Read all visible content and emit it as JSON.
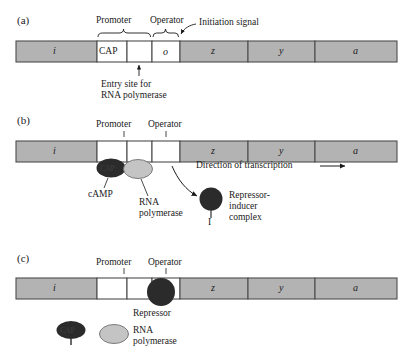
{
  "figure": {
    "colors": {
      "gene_fill": "#b3b3b3",
      "gene_stroke": "#4d4d4d",
      "white_fill": "#ffffff",
      "repressor_fill": "#2b2b2b",
      "cap_fill": "#2b2b2b",
      "polymerase_fill": "#c4c4c4",
      "line": "#1a1a1a"
    }
  },
  "panels": [
    {
      "id": "a",
      "label": "(a)",
      "segments": [
        {
          "name": "i",
          "label": "i",
          "filled": true
        },
        {
          "name": "cap",
          "label": "CAP",
          "filled": false
        },
        {
          "name": "entry",
          "label": "",
          "filled": false
        },
        {
          "name": "o",
          "label": "o",
          "filled": false
        },
        {
          "name": "z",
          "label": "z",
          "filled": true
        },
        {
          "name": "y",
          "label": "y",
          "filled": true
        },
        {
          "name": "a",
          "label": "a",
          "filled": true
        }
      ],
      "brackets": [
        {
          "name": "promoter",
          "label": "Promoter"
        },
        {
          "name": "operator",
          "label": "Operator"
        }
      ],
      "annotations": [
        {
          "name": "initiation-signal",
          "label": "Initiation signal"
        },
        {
          "name": "entry-site",
          "line1": "Entry site for",
          "line2": "RNA polymerase"
        }
      ]
    },
    {
      "id": "b",
      "label": "(b)",
      "segments": [
        {
          "name": "i",
          "label": "i",
          "filled": true
        },
        {
          "name": "cap",
          "label": "",
          "filled": false
        },
        {
          "name": "entry",
          "label": "",
          "filled": false
        },
        {
          "name": "o",
          "label": "",
          "filled": false
        },
        {
          "name": "z",
          "label": "z",
          "filled": true
        },
        {
          "name": "y",
          "label": "y",
          "filled": true
        },
        {
          "name": "a",
          "label": "a",
          "filled": true
        }
      ],
      "brackets": [
        {
          "name": "promoter",
          "label": "Promoter"
        },
        {
          "name": "operator",
          "label": "Operator"
        }
      ],
      "annotations": [
        {
          "name": "cap-protein",
          "label": "CAP"
        },
        {
          "name": "camp",
          "label": "cAMP"
        },
        {
          "name": "rna-polymerase",
          "line1": "RNA",
          "line2": "polymerase"
        },
        {
          "name": "direction-of-transcription",
          "label": "Direction of transcription"
        },
        {
          "name": "inducer",
          "label": "I"
        },
        {
          "name": "repressor-inducer-complex",
          "line1": "Repressor-",
          "line2": "inducer",
          "line3": "complex"
        }
      ]
    },
    {
      "id": "c",
      "label": "(c)",
      "segments": [
        {
          "name": "i",
          "label": "i",
          "filled": true
        },
        {
          "name": "cap",
          "label": "",
          "filled": false
        },
        {
          "name": "entry",
          "label": "",
          "filled": false
        },
        {
          "name": "o",
          "label": "",
          "filled": false
        },
        {
          "name": "z",
          "label": "z",
          "filled": true
        },
        {
          "name": "y",
          "label": "y",
          "filled": true
        },
        {
          "name": "a",
          "label": "a",
          "filled": true
        }
      ],
      "brackets": [
        {
          "name": "promoter",
          "label": "Promoter"
        },
        {
          "name": "operator",
          "label": "Operator"
        }
      ],
      "annotations": [
        {
          "name": "repressor",
          "label": "Repressor"
        }
      ]
    }
  ],
  "legend": {
    "items": [
      {
        "name": "cap-camp",
        "label": "CAP"
      },
      {
        "name": "rna-polymerase",
        "line1": "RNA",
        "line2": "polymerase"
      }
    ]
  }
}
